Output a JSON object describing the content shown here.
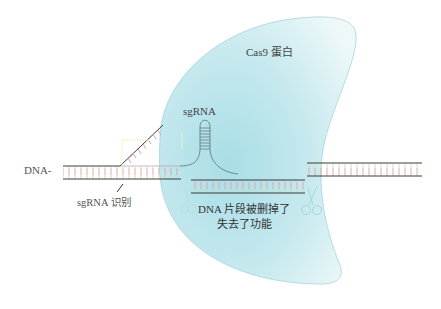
{
  "diagram": {
    "labels": {
      "cas9": "Cas9 蛋白",
      "sgrna": "sgRNA",
      "dna": "DNA-",
      "sgrna_recognition": "sgRNA 识别",
      "cut_line1": "DNA 片段被删掉了",
      "cut_line2": "失去了功能"
    },
    "colors": {
      "cas9_fill": "#bfe6ec",
      "cas9_fill_light": "#e6f6f8",
      "cas9_outline": "#9dd6dc",
      "strand": "#3b3b3b",
      "rung_red": "#e3a0a6",
      "rung_green": "#cfe3b8",
      "sgrna": "#5f7f86",
      "scissors": "#a8dcdc"
    },
    "elements": [
      "Cas9 protein (crescent shape)",
      "sgRNA hairpin",
      "left DNA double strand with unwound region",
      "excised DNA fragment",
      "right DNA double strand",
      "two scissors at cut sites"
    ]
  }
}
